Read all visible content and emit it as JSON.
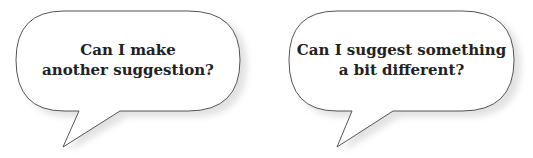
{
  "bubbles": [
    {
      "lines": [
        "Can I make",
        "another suggestion?"
      ]
    },
    {
      "lines": [
        "Can I suggest something",
        "a bit different?"
      ]
    }
  ],
  "colors": {
    "background": "#ffffff",
    "bubble_fill": "#ffffff",
    "bubble_stroke": "#555555",
    "shadow": "#d9d9d9",
    "text": "#222222"
  }
}
